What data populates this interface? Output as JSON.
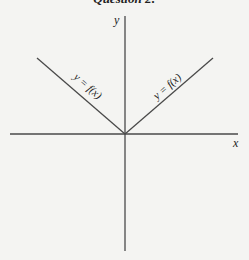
{
  "title": "Question 2:",
  "diagram": {
    "axis_labels": {
      "x": "x",
      "y": "y"
    },
    "left_branch_label": "y = f(x)",
    "right_branch_label": "y = f(x)",
    "colors": {
      "axis": "#4a4a4a",
      "line": "#4a4a4a",
      "background": "#f4f4f2"
    }
  }
}
